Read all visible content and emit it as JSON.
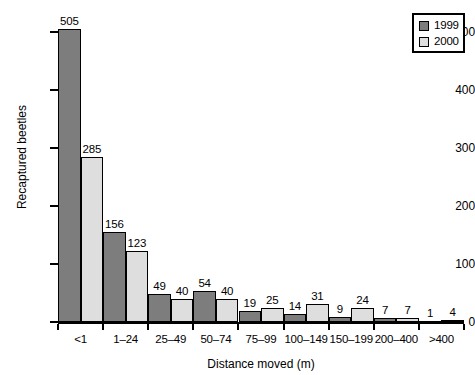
{
  "chart_data": {
    "type": "bar",
    "title": "",
    "xlabel": "Distance moved (m)",
    "ylabel": "Recaptured beetles",
    "categories": [
      "<1",
      "1–24",
      "25–49",
      "50–74",
      "75–99",
      "100–149",
      "150–199",
      "200–400",
      ">400"
    ],
    "series": [
      {
        "name": "1999",
        "color": "#7d7d7d",
        "values": [
          505,
          156,
          49,
          54,
          19,
          14,
          9,
          7,
          1
        ]
      },
      {
        "name": "2000",
        "color": "#dedede",
        "values": [
          285,
          123,
          40,
          40,
          25,
          31,
          24,
          7,
          4
        ]
      }
    ],
    "ylim": [
      0,
      530
    ],
    "yticks": [
      0,
      100,
      200,
      300,
      400,
      500
    ],
    "ytick_labels": [
      "0",
      "100",
      "200",
      "300",
      "400",
      "500"
    ],
    "grid": false,
    "data_labels": true,
    "legend_position": "top-right"
  },
  "legend": {
    "entries": [
      {
        "label": "1999",
        "swatch": "dark-gray-swatch"
      },
      {
        "label": "2000",
        "swatch": "light-gray-swatch"
      }
    ]
  }
}
